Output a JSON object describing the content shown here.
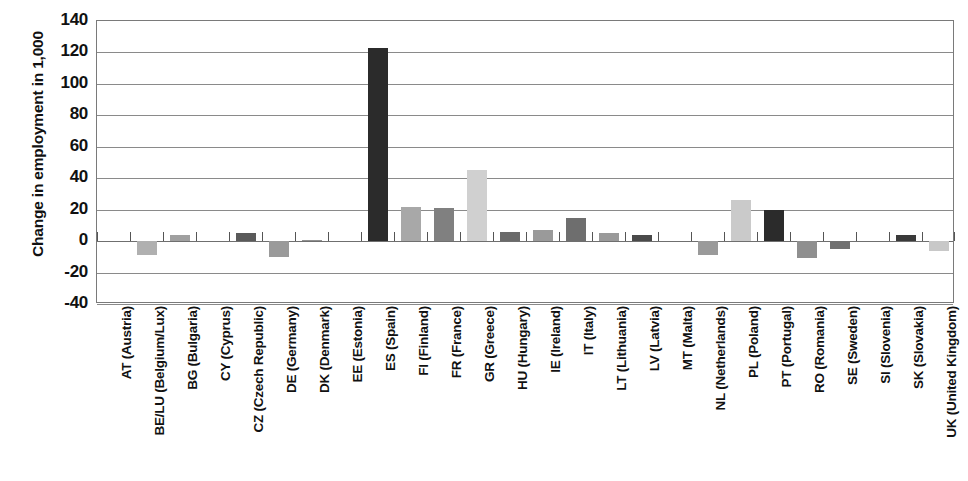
{
  "chart_data": {
    "type": "bar",
    "title": "",
    "xlabel": "",
    "ylabel": "Change in employment in 1,000",
    "ylim": [
      -40,
      140
    ],
    "yticks": [
      140,
      120,
      100,
      80,
      60,
      40,
      20,
      0,
      -20,
      -40
    ],
    "ytick_labels": [
      "140",
      "120",
      "100",
      "80",
      "60",
      "40",
      "20",
      "0",
      "-20",
      "-40"
    ],
    "grid": true,
    "legend": "none",
    "categories": [
      "AT (Austria)",
      "BE/LU (Belgium/Lux)",
      "BG (Bulgaria)",
      "CY (Cyprus)",
      "CZ (Czech Republic)",
      "DE (Germany)",
      "DK (Denmark)",
      "EE (Estonia)",
      "ES (Spain)",
      "FI (Finland)",
      "FR (France)",
      "GR (Greece)",
      "HU (Hungary)",
      "IE (Ireland)",
      "IT (Italy)",
      "LT (Lithuania)",
      "LV (Latvia)",
      "MT (Malta)",
      "NL (Netherlands)",
      "PL (Poland)",
      "PT (Portugal)",
      "RO (Romania)",
      "SE (Sweden)",
      "SI (Slovenia)",
      "SK (Slovakia)",
      "UK (United Kingdom)"
    ],
    "values": [
      0,
      -9,
      4,
      0,
      5,
      -10,
      1,
      0.5,
      123,
      22,
      21,
      45,
      6,
      7,
      15,
      5,
      4,
      0,
      -9,
      26,
      20,
      -11,
      -5,
      0.5,
      4,
      -6
    ],
    "bar_colors": [
      "#b8b8b8",
      "#b0b0b0",
      "#a0a0a0",
      "#c8c8c8",
      "#5a5a5a",
      "#9a9a9a",
      "#909090",
      "#8a8a8a",
      "#2b2b2b",
      "#a8a8a8",
      "#808080",
      "#d0d0d0",
      "#6a6a6a",
      "#9a9a9a",
      "#6e6e6e",
      "#9a9a9a",
      "#4a4a4a",
      "#b0b0b0",
      "#9a9a9a",
      "#cacaca",
      "#2b2b2b",
      "#8f8f8f",
      "#707070",
      "#b0b0b0",
      "#3a3a3a",
      "#c8c8c8"
    ]
  }
}
